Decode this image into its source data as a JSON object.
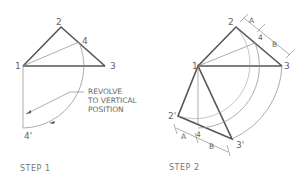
{
  "step1": {
    "caption": "STEP 1",
    "labels": {
      "p1": "1",
      "p2": "2",
      "p3": "3",
      "p4": "4",
      "p4prime": "4'"
    },
    "annotation": {
      "line1": "REVOLVE",
      "line2": "TO VERTICAL",
      "line3": "POSITION"
    }
  },
  "step2": {
    "caption": "STEP 2",
    "labels": {
      "p1": "1",
      "p2": "2",
      "p3": "3",
      "p4": "4",
      "p2prime": "2'",
      "p3prime": "3'",
      "p4prime": "4'"
    },
    "dimensions": {
      "a_top": "A",
      "b_top": "B",
      "a_bottom": "A",
      "b_bottom": "B"
    }
  },
  "colors": {
    "line": "#555555",
    "construction": "#8a8a8a",
    "text": "#666666"
  }
}
